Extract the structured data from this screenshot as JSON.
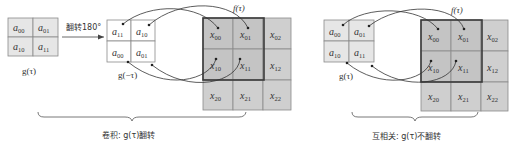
{
  "left_panel": {
    "kernel_original": {
      "cells": [
        [
          "a00",
          "a01"
        ],
        [
          "a10",
          "a11"
        ]
      ],
      "label": "g(τ)"
    },
    "flip_arrow_label": "翻转180°",
    "kernel_flipped": {
      "cells": [
        [
          "a11",
          "a10"
        ],
        [
          "a01",
          "a00"
        ]
      ],
      "label": "g(−τ)"
    },
    "input": {
      "label": "f(τ)",
      "cells": [
        [
          "x00",
          "x01",
          "x02"
        ],
        [
          "x10",
          "x11",
          "x12"
        ],
        [
          "x20",
          "x21",
          "x22"
        ]
      ]
    },
    "caption": "卷积: g(τ)翻转"
  },
  "right_panel": {
    "kernel": {
      "cells": [
        [
          "a00",
          "a01"
        ],
        [
          "a10",
          "a11"
        ]
      ],
      "label": "g(τ)"
    },
    "input": {
      "label": "f(τ)",
      "cells": [
        [
          "x00",
          "x01",
          "x02"
        ],
        [
          "x10",
          "x11",
          "x12"
        ],
        [
          "x20",
          "x21",
          "x22"
        ]
      ]
    },
    "caption": "互相关: g(τ)不翻转"
  },
  "colors": {
    "kernel_fill": "#e6e6e6",
    "input_fill": "#c4c4c4",
    "frame": "#3a3a3a"
  }
}
